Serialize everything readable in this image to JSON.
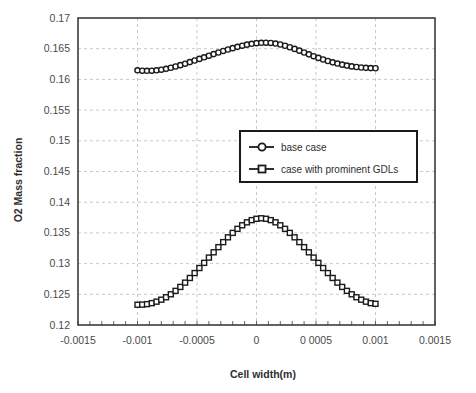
{
  "chart_data": {
    "type": "line",
    "title": "",
    "xlabel": "Cell width(m)",
    "ylabel": "O2 Mass fraction",
    "xlim": [
      -0.0015,
      0.0015
    ],
    "ylim": [
      0.12,
      0.17
    ],
    "xticks": [
      -0.0015,
      -0.001,
      -0.0005,
      0,
      0.0005,
      0.001,
      0.0015
    ],
    "xtick_labels": [
      "-0.0015",
      "-0.001",
      "-0.0005",
      "0",
      "0 0005",
      "0.001",
      "0.0015"
    ],
    "yticks": [
      0.12,
      0.125,
      0.13,
      0.135,
      0.14,
      0.145,
      0.15,
      0.155,
      0.16,
      0.165,
      0.17
    ],
    "ytick_labels": [
      "0.12",
      "0.125",
      "0.13",
      "0.135",
      "0.14",
      "0.145",
      "0.15",
      "0.155",
      "0.16",
      "0.165",
      "0.17"
    ],
    "grid": true,
    "legend_position": "center-right",
    "series": [
      {
        "name": "base case",
        "marker": "circle",
        "color": "#1a1a1a",
        "x": [
          -0.001,
          -0.00096,
          -0.00092,
          -0.00088,
          -0.00084,
          -0.0008,
          -0.00076,
          -0.00072,
          -0.00068,
          -0.00064,
          -0.0006,
          -0.00056,
          -0.00052,
          -0.00048,
          -0.00044,
          -0.0004,
          -0.00036,
          -0.00032,
          -0.00028,
          -0.00024,
          -0.0002,
          -0.00016,
          -0.00012,
          -8e-05,
          -4e-05,
          0.0,
          4e-05,
          8e-05,
          0.00012,
          0.00016,
          0.0002,
          0.00024,
          0.00028,
          0.00032,
          0.00036,
          0.0004,
          0.00044,
          0.00048,
          0.00052,
          0.00056,
          0.0006,
          0.00064,
          0.00068,
          0.00072,
          0.00076,
          0.0008,
          0.00084,
          0.00088,
          0.00092,
          0.00096,
          0.001
        ],
        "y": [
          0.16148,
          0.16142,
          0.1614,
          0.16142,
          0.16148,
          0.16158,
          0.16172,
          0.1619,
          0.1621,
          0.16232,
          0.16256,
          0.16282,
          0.16308,
          0.16334,
          0.1636,
          0.16386,
          0.16412,
          0.16438,
          0.16463,
          0.16487,
          0.16509,
          0.1653,
          0.16549,
          0.16566,
          0.1658,
          0.1659,
          0.16596,
          0.16598,
          0.16594,
          0.16584,
          0.16568,
          0.16548,
          0.16524,
          0.16497,
          0.16468,
          0.16438,
          0.16408,
          0.16378,
          0.1635,
          0.16324,
          0.163,
          0.16278,
          0.16258,
          0.1624,
          0.16225,
          0.16212,
          0.16202,
          0.16194,
          0.16188,
          0.16184,
          0.16182
        ]
      },
      {
        "name": "case with prominent GDLs",
        "marker": "square",
        "color": "#1a1a1a",
        "x": [
          -0.001,
          -0.00096,
          -0.00092,
          -0.00088,
          -0.00084,
          -0.0008,
          -0.00076,
          -0.00072,
          -0.00068,
          -0.00064,
          -0.0006,
          -0.00056,
          -0.00052,
          -0.00048,
          -0.00044,
          -0.0004,
          -0.00036,
          -0.00032,
          -0.00028,
          -0.00024,
          -0.0002,
          -0.00016,
          -0.00012,
          -8e-05,
          -4e-05,
          0.0,
          4e-05,
          8e-05,
          0.00012,
          0.00016,
          0.0002,
          0.00024,
          0.00028,
          0.00032,
          0.00036,
          0.0004,
          0.00044,
          0.00048,
          0.00052,
          0.00056,
          0.0006,
          0.00064,
          0.00068,
          0.00072,
          0.00076,
          0.0008,
          0.00084,
          0.00088,
          0.00092,
          0.00096,
          0.001
        ],
        "y": [
          0.1233,
          0.12332,
          0.1234,
          0.12356,
          0.1238,
          0.12412,
          0.12452,
          0.125,
          0.12556,
          0.1262,
          0.1269,
          0.12766,
          0.12846,
          0.12928,
          0.13012,
          0.13098,
          0.13184,
          0.13268,
          0.1335,
          0.13428,
          0.135,
          0.13566,
          0.13624,
          0.13672,
          0.13708,
          0.1373,
          0.13738,
          0.1373,
          0.13708,
          0.13672,
          0.13624,
          0.13566,
          0.135,
          0.13428,
          0.1335,
          0.13268,
          0.13184,
          0.13098,
          0.13012,
          0.12928,
          0.12846,
          0.12766,
          0.1269,
          0.1262,
          0.12556,
          0.125,
          0.12452,
          0.12412,
          0.1238,
          0.12356,
          0.12345
        ]
      }
    ]
  },
  "colors": {
    "plot_border": "#3b3b3b",
    "grid": "#c9c9c9",
    "marker_edge": "#1a1a1a",
    "marker_fill": "#ffffff",
    "legend_border": "#1a1a1a",
    "background": "#ffffff"
  },
  "legend": {
    "entries": [
      {
        "label": "base case",
        "marker": "circle"
      },
      {
        "label": "case with prominent GDLs",
        "marker": "square"
      }
    ]
  }
}
